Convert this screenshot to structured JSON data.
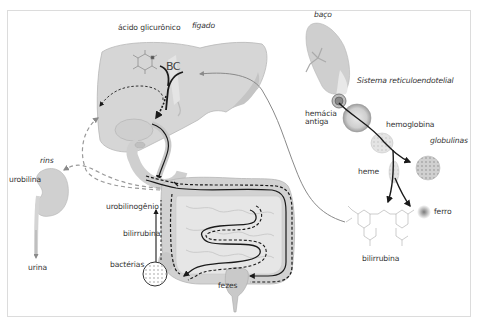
{
  "diagram": {
    "labels": {
      "acido_glicuronico": "ácido glicurônico",
      "figado": "fígado",
      "bc": "BC",
      "baco": "baço",
      "sistema_reticuloendotelial": "Sistema reticuloendotelial",
      "hemacia_antiga": "hemácia\nantiga",
      "hemoglobina": "hemoglobina",
      "globulinas": "globulinas",
      "heme": "heme",
      "ferro": "ferro",
      "bilirrubina_molecule": "bilirrubina",
      "rins": "rins",
      "urobilina": "urobilina",
      "urina": "urina",
      "urobilinogenio": "urobilinogênio",
      "bilirrubina_intestine": "bilirrubina",
      "bacterias": "bactérias",
      "fezes": "fezes"
    },
    "colors": {
      "organ_fill": "#d9d9d9",
      "organ_dark": "#bdbdbd",
      "arrow_black": "#1a1a1a",
      "arrow_gray": "#8a8a8a",
      "text": "#333333",
      "frame": "#dcdcdc"
    }
  }
}
